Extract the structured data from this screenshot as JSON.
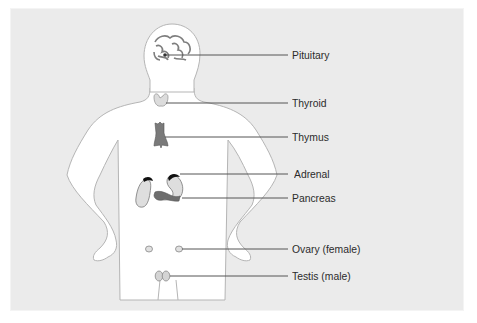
{
  "diagram": {
    "figure": "human-body-outline",
    "colors": {
      "background": "#ebebeb",
      "body_fill": "#ffffff",
      "outline": "#b0b0b0",
      "leader_line": "#555555",
      "organ_dark": "#7a7a7a",
      "organ_light": "#c4c4c4",
      "label_text": "#2b2b2b"
    },
    "labels": [
      {
        "id": "pituitary",
        "text": "Pituitary"
      },
      {
        "id": "thyroid",
        "text": "Thyroid"
      },
      {
        "id": "thymus",
        "text": "Thymus"
      },
      {
        "id": "adrenal",
        "text": "Adrenal"
      },
      {
        "id": "pancreas",
        "text": "Pancreas"
      },
      {
        "id": "ovary",
        "text": "Ovary (female)"
      },
      {
        "id": "testis",
        "text": "Testis (male)"
      }
    ]
  }
}
